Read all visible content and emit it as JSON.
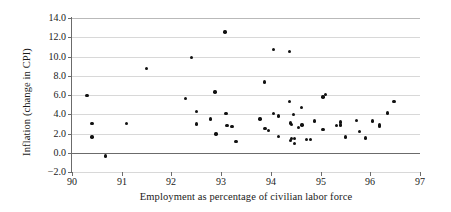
{
  "chart_data": {
    "type": "scatter",
    "title": "",
    "xlabel": "Employment as percentage of civilian labor force",
    "ylabel": "Inflation (change in CPI)",
    "xlim": [
      90,
      97
    ],
    "ylim": [
      -2.0,
      14.0
    ],
    "xticks": [
      90,
      91,
      92,
      93,
      94,
      95,
      96,
      97
    ],
    "xtick_labels": [
      "90",
      "91",
      "92",
      "93",
      "94",
      "95",
      "96",
      "97"
    ],
    "yticks": [
      -2.0,
      0.0,
      2.0,
      4.0,
      6.0,
      8.0,
      10.0,
      12.0,
      14.0
    ],
    "ytick_labels": [
      "-2.0",
      "0.0",
      "2.0",
      "4.0",
      "6.0",
      "8.0",
      "10.0",
      "12.0",
      "14.0"
    ],
    "grid": "horizontal",
    "legend": "none",
    "marker_color": "#111111",
    "grid_color": "#d8d8d8",
    "axis_color": "#6b6b6b",
    "points": [
      {
        "x": 90.3,
        "y": 5.95
      },
      {
        "x": 90.4,
        "y": 3.05
      },
      {
        "x": 90.4,
        "y": 1.65
      },
      {
        "x": 90.67,
        "y": -0.35
      },
      {
        "x": 91.1,
        "y": 3.05
      },
      {
        "x": 91.5,
        "y": 8.75
      },
      {
        "x": 92.28,
        "y": 5.65
      },
      {
        "x": 92.4,
        "y": 9.9
      },
      {
        "x": 92.5,
        "y": 4.3
      },
      {
        "x": 92.5,
        "y": 3.0
      },
      {
        "x": 92.78,
        "y": 3.5
      },
      {
        "x": 92.88,
        "y": 6.3
      },
      {
        "x": 92.9,
        "y": 1.95
      },
      {
        "x": 93.08,
        "y": 12.55
      },
      {
        "x": 93.1,
        "y": 4.1
      },
      {
        "x": 93.12,
        "y": 2.85
      },
      {
        "x": 93.22,
        "y": 2.7
      },
      {
        "x": 93.3,
        "y": 1.15
      },
      {
        "x": 93.78,
        "y": 3.5
      },
      {
        "x": 93.87,
        "y": 7.35
      },
      {
        "x": 93.88,
        "y": 2.55
      },
      {
        "x": 93.95,
        "y": 2.3
      },
      {
        "x": 94.05,
        "y": 10.75
      },
      {
        "x": 94.05,
        "y": 4.1
      },
      {
        "x": 94.15,
        "y": 3.8
      },
      {
        "x": 94.15,
        "y": 1.7
      },
      {
        "x": 94.37,
        "y": 10.5
      },
      {
        "x": 94.37,
        "y": 5.3
      },
      {
        "x": 94.4,
        "y": 3.1
      },
      {
        "x": 94.42,
        "y": 2.95
      },
      {
        "x": 94.42,
        "y": 1.45
      },
      {
        "x": 94.4,
        "y": 1.3
      },
      {
        "x": 94.45,
        "y": 4.0
      },
      {
        "x": 94.47,
        "y": 1.5
      },
      {
        "x": 94.48,
        "y": 0.95
      },
      {
        "x": 94.55,
        "y": 2.65
      },
      {
        "x": 94.62,
        "y": 4.7
      },
      {
        "x": 94.63,
        "y": 2.9
      },
      {
        "x": 94.72,
        "y": 1.4
      },
      {
        "x": 94.8,
        "y": 1.35
      },
      {
        "x": 94.88,
        "y": 3.3
      },
      {
        "x": 95.05,
        "y": 5.8
      },
      {
        "x": 95.1,
        "y": 6.05
      },
      {
        "x": 95.05,
        "y": 2.4
      },
      {
        "x": 95.32,
        "y": 2.85
      },
      {
        "x": 95.4,
        "y": 3.2
      },
      {
        "x": 95.4,
        "y": 2.9
      },
      {
        "x": 95.5,
        "y": 1.65
      },
      {
        "x": 95.72,
        "y": 3.35
      },
      {
        "x": 95.78,
        "y": 2.2
      },
      {
        "x": 95.9,
        "y": 1.55
      },
      {
        "x": 96.05,
        "y": 3.3
      },
      {
        "x": 96.18,
        "y": 2.9
      },
      {
        "x": 96.18,
        "y": 2.75
      },
      {
        "x": 96.35,
        "y": 4.15
      },
      {
        "x": 96.48,
        "y": 5.3
      }
    ]
  }
}
